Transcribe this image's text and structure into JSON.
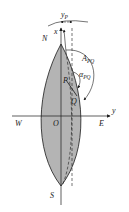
{
  "diagram": {
    "type": "spherical-gore-azimuth",
    "labels": {
      "north": "N",
      "south": "S",
      "west": "W",
      "east": "E",
      "origin": "O",
      "x_axis": "x",
      "y_axis": "y",
      "point_p": "P",
      "point_q": "Q",
      "y_p_main": "y",
      "y_p_sub": "P",
      "azimuth_main": "A",
      "azimuth_sub": "PQ",
      "alpha_main": "α",
      "alpha_sub": "PQ"
    },
    "colors": {
      "gore_fill": "#b4b4b4",
      "stroke": "#1a1a1a",
      "background": "#ffffff"
    }
  }
}
